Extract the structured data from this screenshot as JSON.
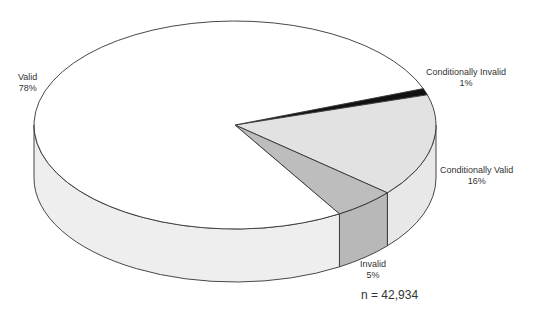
{
  "chart_data": {
    "type": "pie",
    "style": "3d",
    "title": "",
    "categories": [
      "Valid",
      "Conditionally Invalid",
      "Conditionally Valid",
      "Invalid"
    ],
    "values": [
      78,
      1,
      16,
      5
    ],
    "unit": "%",
    "colors": [
      "#ffffff",
      "#111111",
      "#e2e2e2",
      "#bdbdbd"
    ],
    "side_colors": [
      "#eeeeee",
      "#111111",
      "#e8e8e8",
      "#b8b8b8"
    ],
    "annotation": "n = 42,934",
    "legend": "none (direct labels)"
  },
  "labels": {
    "valid": {
      "name": "Valid",
      "pct": "78%"
    },
    "cond_invalid": {
      "name": "Conditionally Invalid",
      "pct": "1%"
    },
    "cond_valid": {
      "name": "Conditionally Valid",
      "pct": "16%"
    },
    "invalid": {
      "name": "Invalid",
      "pct": "5%"
    }
  },
  "sample_size": "n = 42,934"
}
